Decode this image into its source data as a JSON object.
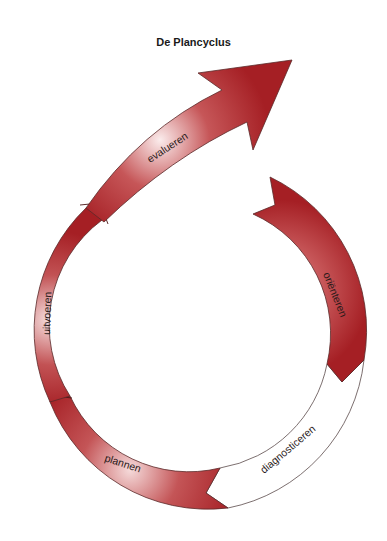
{
  "title": "De Plancyclus",
  "colors": {
    "segment_dark": "#a51f24",
    "segment_light": "#f6dcdc",
    "outline": "#5a2a2a",
    "inactive_fill": "#ffffff"
  },
  "phases": [
    {
      "id": "orienteren",
      "label": "oriënteren",
      "active": true
    },
    {
      "id": "diagnosticeren",
      "label": "diagnosticeren",
      "active": false
    },
    {
      "id": "plannen",
      "label": "plannen",
      "active": true
    },
    {
      "id": "uitvoeren",
      "label": "uitvoeren",
      "active": true
    },
    {
      "id": "evalueren",
      "label": "evalueren",
      "active": true
    }
  ]
}
